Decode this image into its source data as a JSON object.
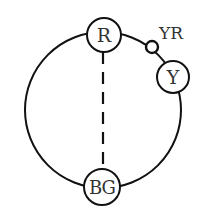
{
  "diagram": {
    "type": "circular-color-relation",
    "colors": {
      "stroke": "#111111",
      "text": "#333333",
      "fill": "#ffffff"
    },
    "ring": {
      "cx": 103,
      "cy": 110,
      "r": 78
    },
    "nodes": [
      {
        "id": "R",
        "label": "R",
        "cx": 104,
        "cy": 35,
        "r": 17
      },
      {
        "id": "Y",
        "label": "Y",
        "cx": 173,
        "cy": 77,
        "r": 16
      },
      {
        "id": "BG",
        "label": "BG",
        "cx": 102,
        "cy": 187,
        "r": 18
      }
    ],
    "marker": {
      "id": "YR",
      "label": "YR",
      "cx": 152,
      "cy": 47,
      "r": 6,
      "label_x": 158,
      "label_y": 39
    },
    "edges": [
      {
        "from": "R",
        "to": "BG",
        "style": "dashed"
      }
    ]
  }
}
